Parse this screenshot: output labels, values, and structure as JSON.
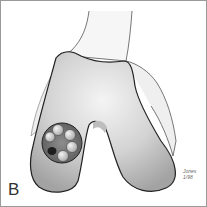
{
  "figure": {
    "panel_label": "B",
    "signature_line1": "Jones",
    "signature_line2": "1/98",
    "colors": {
      "border": "#9a9a9a",
      "bone_light": "#f2f2f2",
      "bone_mid": "#cfcfcf",
      "bone_dark": "#9d9d9d",
      "outline": "#222222",
      "defect_dark": "#3a3a3a",
      "plug": "#d9d9d9"
    },
    "plugs": [
      {
        "cx": 59,
        "cy": 129
      },
      {
        "cx": 69,
        "cy": 134
      },
      {
        "cx": 71,
        "cy": 146
      },
      {
        "cx": 62,
        "cy": 155
      },
      {
        "cx": 51,
        "cy": 136
      }
    ]
  }
}
